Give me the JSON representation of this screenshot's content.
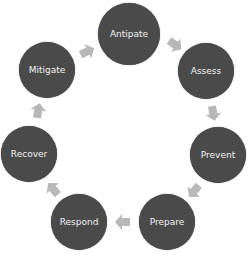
{
  "diagram": {
    "type": "cycle",
    "colors": {
      "node_fill": "#4a4a4a",
      "node_text": "#f2f2f2",
      "arrow": "#b8b8b8"
    },
    "nodes": [
      {
        "label": "Antipate",
        "cx": 129,
        "cy": 34,
        "r": 31
      },
      {
        "label": "Assess",
        "cx": 206,
        "cy": 71,
        "r": 28
      },
      {
        "label": "Prevent",
        "cx": 218,
        "cy": 155,
        "r": 28
      },
      {
        "label": "Prepare",
        "cx": 167,
        "cy": 222,
        "r": 28
      },
      {
        "label": "Respond",
        "cx": 79,
        "cy": 222,
        "r": 28
      },
      {
        "label": "Recover",
        "cx": 29,
        "cy": 154,
        "r": 28
      },
      {
        "label": "Mitigate",
        "cx": 47,
        "cy": 70,
        "r": 28
      }
    ]
  }
}
